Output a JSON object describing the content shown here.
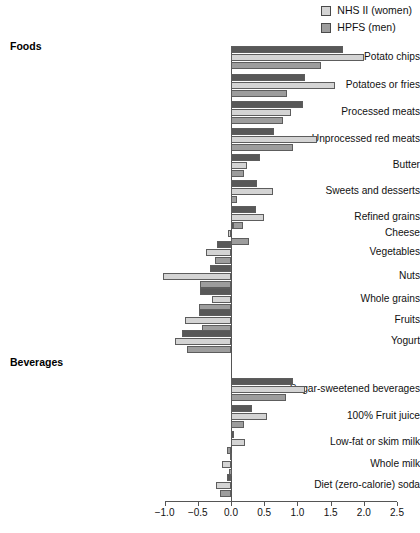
{
  "legend": {
    "position": "top-right",
    "items": [
      {
        "label": "NHS II (women)",
        "color": "#d4d4d4",
        "name": "nhs2-women"
      },
      {
        "label": "HPFS (men)",
        "color": "#9d9d9d",
        "name": "hpfs-men"
      }
    ]
  },
  "sections": [
    {
      "label": "Foods",
      "y": 40
    },
    {
      "label": "Beverages",
      "y": 356
    }
  ],
  "axis": {
    "xlabel": "",
    "ticks": [
      "-1.0",
      "-0.5",
      "0.0",
      "0.5",
      "1.0",
      "1.5",
      "2.0",
      "2.5"
    ],
    "tick_values": [
      -1.0,
      -0.5,
      0.0,
      0.5,
      1.0,
      1.5,
      2.0,
      2.5
    ],
    "xlim": [
      -1.0,
      2.5
    ]
  },
  "colors": {
    "series1": "#585858",
    "series2": "#d4d4d4",
    "series3": "#9d9d9d",
    "axis": "#555555",
    "bar_outline": "#5d5d5d"
  },
  "chart_data": {
    "type": "bar",
    "orientation": "horizontal",
    "title": "",
    "xlabel": "",
    "ylabel": "",
    "xlim": [
      -1.0,
      2.5
    ],
    "grid": false,
    "legend_position": "top-right",
    "groups": [
      "Foods",
      "Beverages"
    ],
    "categories": [
      "Potato chips",
      "Potatoes or fries",
      "Processed meats",
      "Unprocessed red meats",
      "Butter",
      "Sweets and desserts",
      "Refined grains",
      "Cheese",
      "Vegetables",
      "Nuts",
      "Whole grains",
      "Fruits",
      "Yogurt",
      "Sugar-sweetened beverages",
      "100% Fruit juice",
      "Low-fat or skim milk",
      "Whole milk",
      "Diet (zero-calorie) soda"
    ],
    "series": [
      {
        "name": "Pooled",
        "color": "#585858",
        "values": [
          1.68,
          1.11,
          1.09,
          0.65,
          0.43,
          0.39,
          0.37,
          0.03,
          -0.21,
          -0.32,
          -0.47,
          -0.48,
          -0.74,
          0.93,
          0.32,
          0.03,
          -0.02,
          -0.06
        ]
      },
      {
        "name": "NHS II (women)",
        "color": "#d4d4d4",
        "values": [
          2.01,
          1.57,
          0.91,
          1.29,
          0.24,
          0.63,
          0.5,
          -0.04,
          -0.37,
          -1.02,
          -0.29,
          -0.69,
          -0.84,
          1.12,
          0.54,
          0.21,
          -0.14,
          -0.23
        ]
      },
      {
        "name": "HPFS (men)",
        "color": "#9d9d9d",
        "values": [
          1.35,
          0.85,
          0.79,
          0.93,
          0.2,
          0.09,
          0.18,
          0.27,
          -0.24,
          -0.46,
          -0.48,
          -0.44,
          -0.67,
          0.83,
          0.2,
          -0.06,
          -0.03,
          -0.16
        ]
      }
    ]
  }
}
